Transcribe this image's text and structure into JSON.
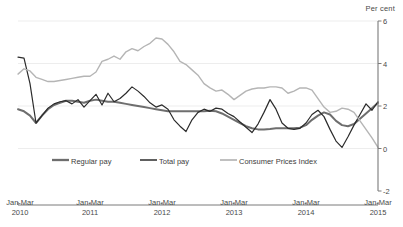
{
  "axis": {
    "unit_label": "Per cent",
    "y_ticks": [
      "6",
      "4",
      "2",
      "0",
      "-2"
    ],
    "x_ticks": [
      {
        "line1": "Jan-Mar",
        "line2": "2010"
      },
      {
        "line1": "Jan-Mar",
        "line2": "2011"
      },
      {
        "line1": "Jan-Mar",
        "line2": "2012"
      },
      {
        "line1": "Jan-Mar",
        "line2": "2013"
      },
      {
        "line1": "Jan-Mar",
        "line2": "2014"
      },
      {
        "line1": "Jan-Mar",
        "line2": "2015"
      }
    ]
  },
  "legend": {
    "items": [
      {
        "label": "Regular pay",
        "color": "#6e6e6e"
      },
      {
        "label": "Total pay",
        "color": "#2b2b2b"
      },
      {
        "label": "Consumer Prices Index",
        "color": "#b5b5b5"
      }
    ]
  },
  "colors": {
    "regular_pay": "#6e6e6e",
    "total_pay": "#2b2b2b",
    "cpi": "#b5b5b5",
    "gridline": "#ededed",
    "axis": "#7a7a7a"
  },
  "chart_data": {
    "type": "line",
    "title": "",
    "subtitle": "",
    "xlabel": "",
    "ylabel": "Per cent",
    "ylim": [
      -2,
      6
    ],
    "y_tick_values": [
      6,
      4,
      2,
      0,
      -2
    ],
    "grid": true,
    "grid_axis": "y",
    "legend_position": "bottom",
    "x_tick_labels": [
      "Jan-Mar 2010",
      "Jan-Mar 2011",
      "Jan-Mar 2012",
      "Jan-Mar 2013",
      "Jan-Mar 2014",
      "Jan-Mar 2015"
    ],
    "x_tick_indices": [
      0,
      12,
      24,
      36,
      48,
      60
    ],
    "x": [
      "Jan-Mar 2010",
      "Feb-Apr 2010",
      "Mar-May 2010",
      "Apr-Jun 2010",
      "May-Jul 2010",
      "Jun-Aug 2010",
      "Jul-Sep 2010",
      "Aug-Oct 2010",
      "Sep-Nov 2010",
      "Oct-Dec 2010",
      "Nov-Jan 2011",
      "Dec-Feb 2011",
      "Jan-Mar 2011",
      "Feb-Apr 2011",
      "Mar-May 2011",
      "Apr-Jun 2011",
      "May-Jul 2011",
      "Jun-Aug 2011",
      "Jul-Sep 2011",
      "Aug-Oct 2011",
      "Sep-Nov 2011",
      "Oct-Dec 2011",
      "Nov-Jan 2012",
      "Dec-Feb 2012",
      "Jan-Mar 2012",
      "Feb-Apr 2012",
      "Mar-May 2012",
      "Apr-Jun 2012",
      "May-Jul 2012",
      "Jun-Aug 2012",
      "Jul-Sep 2012",
      "Aug-Oct 2012",
      "Sep-Nov 2012",
      "Oct-Dec 2012",
      "Nov-Jan 2013",
      "Dec-Feb 2013",
      "Jan-Mar 2013",
      "Feb-Apr 2013",
      "Mar-May 2013",
      "Apr-Jun 2013",
      "May-Jul 2013",
      "Jun-Aug 2013",
      "Jul-Sep 2013",
      "Aug-Oct 2013",
      "Sep-Nov 2013",
      "Oct-Dec 2013",
      "Nov-Jan 2014",
      "Dec-Feb 2014",
      "Jan-Mar 2014",
      "Feb-Apr 2014",
      "Mar-May 2014",
      "Apr-Jun 2014",
      "May-Jul 2014",
      "Jun-Aug 2014",
      "Jul-Sep 2014",
      "Aug-Oct 2014",
      "Sep-Nov 2014",
      "Oct-Dec 2014",
      "Nov-Jan 2015",
      "Dec-Feb 2015",
      "Jan-Mar 2015"
    ],
    "series": [
      {
        "name": "Regular pay",
        "color": "#6e6e6e",
        "line_width": 2.0,
        "values": [
          1.85,
          1.75,
          1.55,
          1.2,
          1.55,
          1.85,
          2.05,
          2.15,
          2.25,
          2.25,
          2.2,
          2.15,
          2.25,
          2.3,
          2.25,
          2.2,
          2.2,
          2.15,
          2.1,
          2.05,
          2.0,
          1.95,
          1.9,
          1.85,
          1.8,
          1.75,
          1.75,
          1.75,
          1.75,
          1.75,
          1.75,
          1.75,
          1.78,
          1.75,
          1.65,
          1.5,
          1.35,
          1.2,
          1.05,
          0.95,
          0.9,
          0.9,
          0.92,
          0.95,
          0.95,
          0.95,
          0.95,
          0.98,
          1.1,
          1.35,
          1.55,
          1.7,
          1.6,
          1.3,
          1.1,
          1.05,
          1.15,
          1.4,
          1.65,
          1.9,
          2.15
        ]
      },
      {
        "name": "Total pay",
        "color": "#2b2b2b",
        "line_width": 1.2,
        "values": [
          4.3,
          4.25,
          3.05,
          1.2,
          1.55,
          1.9,
          2.1,
          2.2,
          2.25,
          2.1,
          2.3,
          1.95,
          2.25,
          2.55,
          2.05,
          2.6,
          2.2,
          2.35,
          2.6,
          2.9,
          2.7,
          2.45,
          2.15,
          1.95,
          2.05,
          1.85,
          1.35,
          1.05,
          0.8,
          1.35,
          1.7,
          1.85,
          1.75,
          1.9,
          1.85,
          1.65,
          1.5,
          1.25,
          1.0,
          0.75,
          1.15,
          1.7,
          2.3,
          1.85,
          1.2,
          0.95,
          0.9,
          0.95,
          1.2,
          1.6,
          1.8,
          1.5,
          0.9,
          0.35,
          0.05,
          0.55,
          1.1,
          1.6,
          2.1,
          1.8,
          2.2
        ]
      },
      {
        "name": "Consumer Prices Index",
        "color": "#b5b5b5",
        "line_width": 1.4,
        "values": [
          3.5,
          3.75,
          3.65,
          3.35,
          3.25,
          3.15,
          3.15,
          3.2,
          3.25,
          3.3,
          3.35,
          3.4,
          3.4,
          3.6,
          4.1,
          4.2,
          4.35,
          4.2,
          4.55,
          4.7,
          4.6,
          4.8,
          4.95,
          5.2,
          5.15,
          4.9,
          4.55,
          4.1,
          3.95,
          3.7,
          3.45,
          3.05,
          2.85,
          2.7,
          2.75,
          2.55,
          2.3,
          2.5,
          2.7,
          2.8,
          2.85,
          2.85,
          2.9,
          2.9,
          2.85,
          2.6,
          2.7,
          2.85,
          2.85,
          2.75,
          2.35,
          1.95,
          1.7,
          1.75,
          1.9,
          1.85,
          1.7,
          1.3,
          0.9,
          0.5,
          0.05
        ]
      }
    ],
    "annotations": []
  }
}
